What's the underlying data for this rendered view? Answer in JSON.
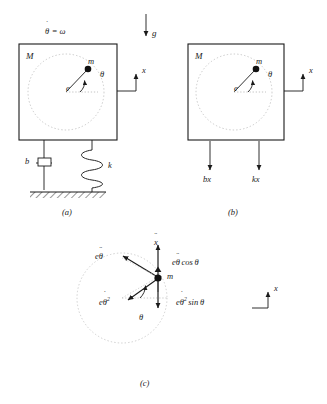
{
  "figure": {
    "gravity_label": "g",
    "panels": [
      {
        "id": "a",
        "caption": "(a)",
        "type": "physical-model",
        "body_label": "M",
        "mass_label": "m",
        "eccentricity_label": "e",
        "angle_label": "θ",
        "rotation_label": "θ = ω",
        "rotation_label_base": "θ",
        "rotation_label_rest": "= ω",
        "axis_label": "x",
        "damper_label": "b",
        "spring_label": "k",
        "has_ground": true
      },
      {
        "id": "b",
        "caption": "(b)",
        "type": "free-body-diagram",
        "body_label": "M",
        "mass_label": "m",
        "eccentricity_label": "e",
        "angle_label": "θ",
        "axis_label": "x",
        "forces": [
          {
            "name": "damping-force",
            "base": "b",
            "variable": "x",
            "dots": 1,
            "label": "bx"
          },
          {
            "name": "spring-force",
            "base": "k",
            "variable": "x",
            "dots": 0,
            "label": "kx"
          }
        ]
      },
      {
        "id": "c",
        "caption": "(c)",
        "type": "acceleration-diagram",
        "mass_label": "m",
        "angle_label": "θ",
        "axis_label": "x",
        "accelerations": [
          {
            "name": "body-acceleration",
            "label": "x",
            "dots": 2,
            "direction": "up"
          },
          {
            "name": "tangential-acceleration",
            "label": "eθ",
            "dots": 2,
            "direction": "up-left"
          },
          {
            "name": "radial-acceleration",
            "label": "eθ",
            "dots": 1,
            "power": "2",
            "direction": "down-left"
          },
          {
            "name": "tangential-component",
            "label": "eθ cos θ",
            "dots": 2,
            "direction": "up"
          },
          {
            "name": "radial-component",
            "label": "eθ sin θ",
            "dots": 1,
            "power": "2",
            "direction": "down"
          }
        ]
      }
    ],
    "colors": {
      "stroke": "#1a1a1a",
      "dotted_circle": "#b9b9b9",
      "background": "#ffffff",
      "mass_fill": "#111111"
    }
  }
}
